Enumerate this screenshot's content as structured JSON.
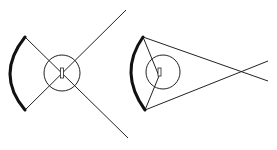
{
  "colors": {
    "background": "#ffffff",
    "stroke": "#222222",
    "arc": "#111111"
  },
  "figures": [
    {
      "name": "diverging-rays-figure",
      "arc": {
        "top": [
          25,
          37
        ],
        "bottom": [
          25,
          110
        ],
        "leftmost": [
          10,
          74
        ],
        "stroke_width": 3
      },
      "circle": {
        "cx": 62,
        "cy": 73,
        "r": 18
      },
      "center_mark": {
        "x": 60.5,
        "y": 68,
        "w": 3,
        "h": 10
      },
      "rays": [
        {
          "from": [
            25,
            37
          ],
          "to": [
            128,
            138
          ]
        },
        {
          "from": [
            25,
            110
          ],
          "to": [
            126,
            10
          ]
        }
      ]
    },
    {
      "name": "converging-rays-figure",
      "arc": {
        "top": [
          143,
          37
        ],
        "bottom": [
          145,
          110
        ],
        "leftmost": [
          131,
          73
        ],
        "stroke_width": 3
      },
      "circle": {
        "cx": 163,
        "cy": 72,
        "r": 17
      },
      "center_mark": {
        "x": 158,
        "y": 68,
        "w": 3,
        "h": 8
      },
      "rays": [
        {
          "from": [
            143,
            37
          ],
          "to": [
            268,
            81
          ]
        },
        {
          "from": [
            145,
            110
          ],
          "to": [
            268,
            61
          ]
        },
        {
          "from": [
            143,
            37
          ],
          "to": [
            159,
            76
          ]
        },
        {
          "from": [
            145,
            110
          ],
          "to": [
            159,
            76
          ]
        }
      ],
      "crossing_point": [
        242,
        72
      ]
    }
  ]
}
